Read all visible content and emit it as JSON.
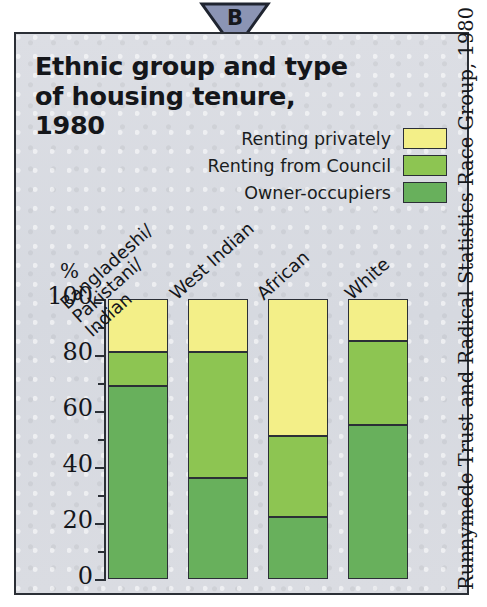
{
  "marker": {
    "letter": "B",
    "shape": "down-triangle",
    "fill": "#8b94b4",
    "stroke": "#1f2430"
  },
  "panel": {
    "background": "#d8dae1",
    "border": "#2b2f36"
  },
  "title": "Ethnic group and type of housing tenure, 1980",
  "source_credit": "Runnymede Trust and Radical Statistics Race Group, 1980",
  "legend": {
    "items": [
      {
        "label": "Renting privately",
        "color": "#f3ef88"
      },
      {
        "label": "Renting from Council",
        "color": "#8dc552"
      },
      {
        "label": "Owner-occupiers",
        "color": "#68b05c"
      }
    ]
  },
  "axis": {
    "y_unit_label": "%",
    "y_ticks_major": [
      "100",
      "80",
      "60",
      "40",
      "20",
      "0"
    ],
    "y_ticks_minor": [
      90,
      70,
      50,
      30,
      10
    ]
  },
  "categories": [
    "Bangladeshi/\nPakistani/\nIndian",
    "West Indian",
    "African",
    "White"
  ],
  "chart_data": {
    "type": "bar",
    "stacked": true,
    "title": "Ethnic group and type of housing tenure, 1980",
    "xlabel": "",
    "ylabel": "%",
    "ylim": [
      0,
      100
    ],
    "yticks": [
      0,
      20,
      40,
      60,
      80,
      100
    ],
    "yticks_minor": [
      10,
      30,
      50,
      70,
      90
    ],
    "grid": false,
    "legend_position": "top-right",
    "categories": [
      "Bangladeshi/Pakistani/Indian",
      "West Indian",
      "African",
      "White"
    ],
    "series": [
      {
        "name": "Owner-occupiers",
        "color": "#68b05c",
        "values": [
          69,
          36,
          22,
          55
        ]
      },
      {
        "name": "Renting from Council",
        "color": "#8dc552",
        "values": [
          12,
          45,
          29,
          30
        ]
      },
      {
        "name": "Renting privately",
        "color": "#f3ef88",
        "values": [
          19,
          19,
          49,
          15
        ]
      }
    ],
    "cumulative_tops": [
      {
        "category": "Bangladeshi/Pakistani/Indian",
        "owner_occupiers": 69,
        "plus_council": 81,
        "total": 100
      },
      {
        "category": "West Indian",
        "owner_occupiers": 36,
        "plus_council": 81,
        "total": 100
      },
      {
        "category": "African",
        "owner_occupiers": 22,
        "plus_council": 51,
        "total": 100
      },
      {
        "category": "White",
        "owner_occupiers": 55,
        "plus_council": 85,
        "total": 100
      }
    ],
    "source": "Runnymede Trust and Radical Statistics Race Group, 1980"
  }
}
